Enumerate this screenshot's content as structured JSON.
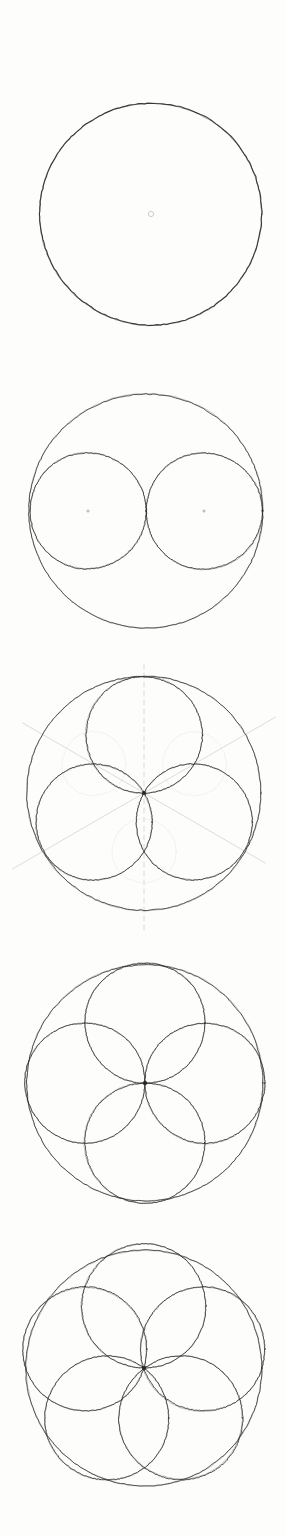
{
  "document": {
    "kind": "hand-drawn-geometry-sheet",
    "title": "Rosette construction sequence",
    "background_color": "#fdfdfc",
    "ink_color": "#262626",
    "faint_ink_color": "#b9b6b4",
    "construction_color": "#c9c6c4",
    "width": 285,
    "height": 1536,
    "panel_count": 5
  },
  "panels": [
    {
      "id": "panel-1",
      "step_label": "Step 1 — base circle",
      "center": {
        "x": 151,
        "y": 214
      },
      "outer_radius": 111,
      "center_dot": true,
      "center_dot_radius": 2.6,
      "inner_circle_count": 0,
      "inner_radius": 0,
      "inner_centers": [],
      "construction_lines": false,
      "stroke_width": 1.15,
      "inner_stroke_width": 0.9
    },
    {
      "id": "panel-2",
      "step_label": "Step 2 — two half-radius circles",
      "center": {
        "x": 146,
        "y": 511
      },
      "outer_radius": 117,
      "center_dot": false,
      "center_dot_radius": 0,
      "inner_circle_count": 2,
      "inner_radius": 58,
      "inner_centers": [
        {
          "x": 88,
          "y": 511,
          "dot": true,
          "faint": false
        },
        {
          "x": 204,
          "y": 511,
          "dot": true,
          "faint": false
        }
      ],
      "construction_lines": false,
      "stroke_width": 0.85,
      "inner_stroke_width": 0.9
    },
    {
      "id": "panel-3",
      "step_label": "Step 3 — three circles with construction rays",
      "center": {
        "x": 144,
        "y": 793
      },
      "outer_radius": 117,
      "center_dot": false,
      "center_dot_radius": 2.2,
      "inner_circle_count": 3,
      "inner_radius": 58,
      "inner_centers": [
        {
          "x": 144,
          "y": 735,
          "dot": false,
          "faint": false
        },
        {
          "x": 194,
          "y": 822,
          "dot": false,
          "faint": false
        },
        {
          "x": 94,
          "y": 822,
          "dot": false,
          "faint": false
        }
      ],
      "construction_lines": true,
      "construction_vertical": {
        "x": 144,
        "y1": 664,
        "y2": 932
      },
      "construction_rays": [
        {
          "angle_deg": -30,
          "length": 152
        },
        {
          "angle_deg": 150,
          "length": 152
        },
        {
          "angle_deg": 210,
          "length": 140
        },
        {
          "angle_deg": 30,
          "length": 140
        }
      ],
      "stroke_width": 0.85,
      "inner_stroke_width": 0.9
    },
    {
      "id": "panel-4",
      "step_label": "Step 4 — four circles rosette",
      "center": {
        "x": 145,
        "y": 1083
      },
      "outer_radius": 118,
      "center_dot": false,
      "center_dot_radius": 0,
      "inner_circle_count": 4,
      "inner_radius": 60,
      "inner_centers": [
        {
          "x": 145,
          "y": 1023,
          "dot": false,
          "faint": false
        },
        {
          "x": 205,
          "y": 1083,
          "dot": false,
          "faint": false
        },
        {
          "x": 145,
          "y": 1143,
          "dot": false,
          "faint": false
        },
        {
          "x": 85,
          "y": 1083,
          "dot": false,
          "faint": false
        }
      ],
      "construction_lines": false,
      "stroke_width": 0.85,
      "inner_stroke_width": 0.9
    },
    {
      "id": "panel-5",
      "step_label": "Step 5 — five circles rosette",
      "center": {
        "x": 144,
        "y": 1368
      },
      "outer_radius": 118,
      "center_dot": false,
      "center_dot_radius": 0,
      "inner_circle_count": 5,
      "inner_radius": 62,
      "inner_centers": [
        {
          "x": 144,
          "y": 1306,
          "dot": false,
          "faint": false
        },
        {
          "x": 203,
          "y": 1349,
          "dot": false,
          "faint": false
        },
        {
          "x": 181,
          "y": 1418,
          "dot": false,
          "faint": false
        },
        {
          "x": 107,
          "y": 1418,
          "dot": false,
          "faint": false
        },
        {
          "x": 85,
          "y": 1349,
          "dot": false,
          "faint": false
        }
      ],
      "construction_lines": false,
      "stroke_width": 0.85,
      "inner_stroke_width": 0.9
    }
  ]
}
